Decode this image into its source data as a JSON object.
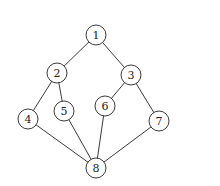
{
  "graph": {
    "node_radius": 10,
    "nodes": [
      {
        "id": "1",
        "label": "1",
        "x": 96,
        "y": 35
      },
      {
        "id": "2",
        "label": "2",
        "x": 57,
        "y": 73
      },
      {
        "id": "3",
        "label": "3",
        "x": 131,
        "y": 75
      },
      {
        "id": "4",
        "label": "4",
        "x": 28,
        "y": 119
      },
      {
        "id": "5",
        "label": "5",
        "x": 64,
        "y": 111
      },
      {
        "id": "6",
        "label": "6",
        "x": 105,
        "y": 106
      },
      {
        "id": "7",
        "label": "7",
        "x": 159,
        "y": 121
      },
      {
        "id": "8",
        "label": "8",
        "x": 96,
        "y": 168
      }
    ],
    "edges": [
      [
        "1",
        "2"
      ],
      [
        "1",
        "3"
      ],
      [
        "2",
        "4"
      ],
      [
        "2",
        "5"
      ],
      [
        "3",
        "6"
      ],
      [
        "3",
        "7"
      ],
      [
        "4",
        "8"
      ],
      [
        "5",
        "8"
      ],
      [
        "6",
        "8"
      ],
      [
        "7",
        "8"
      ]
    ]
  }
}
